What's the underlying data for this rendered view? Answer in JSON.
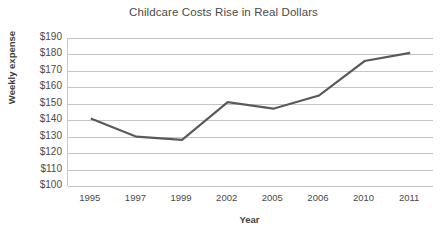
{
  "chart_data": {
    "type": "line",
    "title": "Childcare Costs Rise in Real Dollars",
    "xlabel": "Year",
    "ylabel": "Weekly expense",
    "categories": [
      "1995",
      "1997",
      "1999",
      "2002",
      "2005",
      "2006",
      "2010",
      "2011"
    ],
    "values": [
      141,
      130,
      128,
      151,
      147,
      155,
      176,
      181
    ],
    "series": [
      {
        "name": "Weekly expense",
        "values": [
          141,
          130,
          128,
          151,
          147,
          155,
          176,
          181
        ],
        "color": "#595959"
      }
    ],
    "ylim": [
      100,
      190
    ],
    "ytick_labels": [
      "$190",
      "$180",
      "$170",
      "$160",
      "$150",
      "$140",
      "$130",
      "$120",
      "$110",
      "$100"
    ],
    "ytick_values": [
      190,
      180,
      170,
      160,
      150,
      140,
      130,
      120,
      110,
      100
    ],
    "ystep": 10,
    "grid": true,
    "legend": "none",
    "line_color": "#595959",
    "gridline_color": "#c4c4c4",
    "axis_color": "#c9c9c9",
    "text_color": "#4a4a4a",
    "background": "#ffffff"
  }
}
